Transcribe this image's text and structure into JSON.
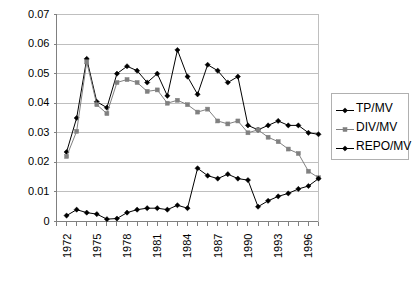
{
  "chart_data": {
    "type": "line",
    "title": "",
    "xlabel": "",
    "ylabel": "",
    "grid": true,
    "legend_position": "right",
    "ylim": [
      0,
      0.07
    ],
    "ytick_labels": [
      "0",
      "0.01",
      "0.02",
      "0.03",
      "0.04",
      "0.05",
      "0.06",
      "0.07"
    ],
    "ytick_values": [
      0,
      0.01,
      0.02,
      0.03,
      0.04,
      0.05,
      0.06,
      0.07
    ],
    "x": [
      1972,
      1973,
      1974,
      1975,
      1976,
      1977,
      1978,
      1979,
      1980,
      1981,
      1982,
      1983,
      1984,
      1985,
      1986,
      1987,
      1988,
      1989,
      1990,
      1991,
      1992,
      1993,
      1994,
      1995,
      1996,
      1997,
      1998
    ],
    "xtick_labels": [
      "1972",
      "1975",
      "1978",
      "1981",
      "1984",
      "1987",
      "1990",
      "1993",
      "1996"
    ],
    "xtick_values": [
      1972,
      1975,
      1978,
      1981,
      1984,
      1987,
      1990,
      1993,
      1996
    ],
    "series": [
      {
        "name": "TP/MV",
        "color": "#000000",
        "marker": "diamond",
        "values": [
          null,
          0.0235,
          0.035,
          0.055,
          0.0405,
          0.0385,
          0.05,
          0.0525,
          0.051,
          0.047,
          0.05,
          0.0425,
          0.058,
          0.049,
          0.043,
          0.053,
          0.051,
          0.047,
          0.049,
          0.0325,
          0.031,
          0.0325,
          0.034,
          0.0325,
          0.0325,
          0.03,
          0.0295
        ]
      },
      {
        "name": "DIV/MV",
        "color": "#808080",
        "marker": "square",
        "values": [
          null,
          0.022,
          0.0305,
          0.054,
          0.0395,
          0.0365,
          0.047,
          0.048,
          0.047,
          0.044,
          0.0445,
          0.04,
          0.041,
          0.0395,
          0.037,
          0.038,
          0.034,
          0.033,
          0.034,
          0.03,
          0.031,
          0.0285,
          0.027,
          0.0245,
          0.023,
          0.017,
          0.0148
        ]
      },
      {
        "name": "REPO/MV",
        "color": "#000000",
        "marker": "diamond",
        "values": [
          null,
          0.002,
          0.004,
          0.003,
          0.0025,
          0.0008,
          0.001,
          0.003,
          0.004,
          0.0045,
          0.0045,
          0.004,
          0.0055,
          0.0045,
          0.018,
          0.0155,
          0.0145,
          0.016,
          0.0145,
          0.014,
          0.005,
          0.007,
          0.0085,
          0.0095,
          0.011,
          0.012,
          0.0145
        ]
      }
    ]
  },
  "legend": {
    "items": [
      {
        "label": "TP/MV"
      },
      {
        "label": "DIV/MV"
      },
      {
        "label": "REPO/MV"
      }
    ]
  }
}
